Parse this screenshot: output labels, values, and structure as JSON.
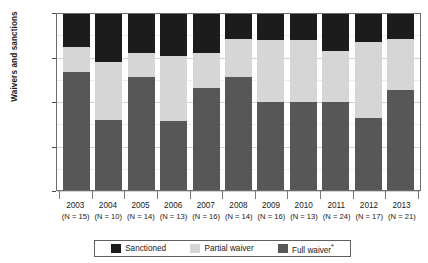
{
  "chart_data": {
    "type": "bar",
    "subtype": "stacked-percentage",
    "title": "",
    "xlabel": "",
    "ylabel": "Waivers and sanctions",
    "ylim": [
      0,
      100
    ],
    "yunit": "%",
    "ytick_labels": [
      "100%",
      "75%",
      "50%",
      "25%",
      "0%"
    ],
    "ytick_values": [
      100,
      75,
      50,
      25,
      0
    ],
    "grid": true,
    "legend_position": "bottom",
    "categories": [
      "2003",
      "2004",
      "2005",
      "2006",
      "2007",
      "2008",
      "2009",
      "2010",
      "2011",
      "2012",
      "2013"
    ],
    "category_sublabels": [
      "(N = 15)",
      "(N = 10)",
      "(N = 14)",
      "(N = 13)",
      "(N = 16)",
      "(N = 14)",
      "(N = 16)",
      "(N = 13)",
      "(N = 24)",
      "(N = 17)",
      "(N = 21)"
    ],
    "sample_sizes": [
      15,
      10,
      14,
      13,
      16,
      14,
      16,
      13,
      24,
      17,
      21
    ],
    "series": [
      {
        "name": "Sanctioned",
        "color": "#1c1c1c",
        "values": [
          19,
          27,
          22,
          24,
          22,
          14,
          15,
          15,
          21,
          16,
          14
        ]
      },
      {
        "name": "Partial waiver",
        "color": "#d6d6d6",
        "values": [
          14,
          33,
          14,
          37,
          20,
          22,
          35,
          35,
          29,
          43,
          29
        ]
      },
      {
        "name": "Full waiver*",
        "color": "#575757",
        "values": [
          67,
          40,
          64,
          39,
          58,
          64,
          50,
          50,
          50,
          41,
          57
        ]
      }
    ],
    "stack_order_bottom_to_top": [
      "Full waiver*",
      "Partial waiver",
      "Sanctioned"
    ]
  },
  "legend": {
    "items": [
      {
        "label": "Sanctioned",
        "color": "#1c1c1c"
      },
      {
        "label": "Partial waiver",
        "color": "#d6d6d6"
      },
      {
        "label": "Full waiver",
        "color": "#575757",
        "footnote_marker": "*"
      }
    ]
  },
  "axis": {
    "y_title": "Waivers and sanctions"
  }
}
